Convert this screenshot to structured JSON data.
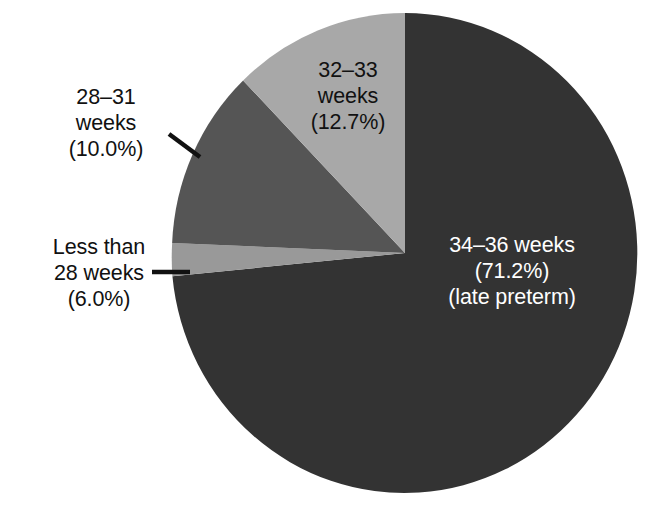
{
  "chart_data": {
    "type": "pie",
    "title": "",
    "subtitle": "",
    "xlabel": "",
    "ylabel": "",
    "legend_position": "none",
    "grid": false,
    "start_angle_deg": 0,
    "direction": "clockwise",
    "units": "percent",
    "categories": [
      "34–36 weeks",
      "Less than 28 weeks",
      "28–31 weeks",
      "32–33 weeks"
    ],
    "values": [
      71.2,
      6.0,
      10.0,
      12.7
    ],
    "slices": [
      {
        "id": "slice-34-36",
        "category": "34–36 weeks",
        "value": 71.2,
        "value_label": "(71.2%)",
        "note": "(late preterm)",
        "color": "#333333",
        "label_placement": "inside",
        "label_color": "#ffffff",
        "leader_line": false
      },
      {
        "id": "slice-less-28",
        "category": "Less than 28 weeks",
        "value": 6.0,
        "value_label": "(6.0%)",
        "note": "",
        "color": "#999999",
        "label_placement": "outside-left",
        "label_color": "#111111",
        "leader_line": true
      },
      {
        "id": "slice-28-31",
        "category": "28–31 weeks",
        "value": 10.0,
        "value_label": "(10.0%)",
        "note": "",
        "color": "#555555",
        "label_placement": "outside-left",
        "label_color": "#111111",
        "leader_line": true
      },
      {
        "id": "slice-32-33",
        "category": "32–33 weeks",
        "value": 12.7,
        "value_label": "(12.7%)",
        "note": "",
        "color": "#a8a8a8",
        "label_placement": "inside",
        "label_color": "#111111",
        "leader_line": false
      }
    ]
  },
  "labels": {
    "label_34_36": {
      "line1": "34–36 weeks",
      "line2": "(71.2%)",
      "line3": "(late preterm)"
    },
    "label_32_33": {
      "line1": "32–33",
      "line2": "weeks",
      "line3": "(12.7%)"
    },
    "label_28_31": {
      "line1": "28–31",
      "line2": "weeks",
      "line3": "(10.0%)"
    },
    "label_less_28": {
      "line1": "Less than",
      "line2": "28 weeks",
      "line3": "(6.0%)"
    }
  },
  "colors": {
    "background": "#ffffff",
    "slice_dark": "#333333",
    "slice_medium_dark": "#555555",
    "slice_medium": "#999999",
    "slice_light": "#a8a8a8",
    "text_dark": "#111111",
    "text_light": "#ffffff",
    "leader_line": "#111111"
  }
}
